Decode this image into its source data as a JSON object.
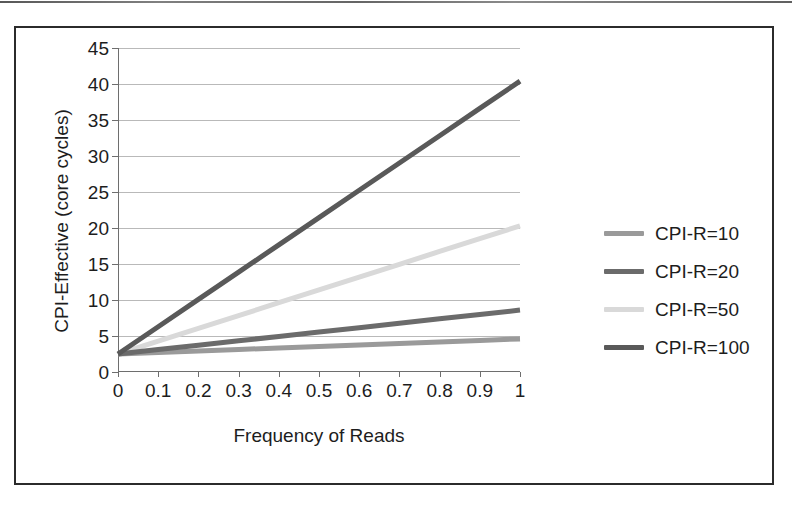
{
  "figure": {
    "has_frame": true,
    "background": "#ffffff"
  },
  "chart_data": {
    "type": "line",
    "title": "",
    "xlabel": "Frequency of Reads",
    "ylabel": "CPI-Effective (core cycles)",
    "xlim": [
      0,
      1
    ],
    "ylim": [
      0,
      45
    ],
    "x": [
      0,
      0.1,
      0.2,
      0.3,
      0.4,
      0.5,
      0.6,
      0.7,
      0.8,
      0.9,
      1
    ],
    "xticks": [
      "0",
      "0.1",
      "0.2",
      "0.3",
      "0.4",
      "0.5",
      "0.6",
      "0.7",
      "0.8",
      "0.9",
      "1"
    ],
    "yticks": [
      "0",
      "5",
      "10",
      "15",
      "20",
      "25",
      "30",
      "35",
      "40",
      "45"
    ],
    "grid": "horizontal",
    "legend_position": "right",
    "series": [
      {
        "name": "CPI-R=10",
        "color": "#9a9a9a",
        "values": [
          2.5,
          2.71,
          2.92,
          3.13,
          3.34,
          3.55,
          3.76,
          3.97,
          4.18,
          4.39,
          4.6
        ]
      },
      {
        "name": "CPI-R=20",
        "color": "#6b6b6b",
        "values": [
          2.5,
          3.11,
          3.72,
          4.33,
          4.94,
          5.55,
          6.16,
          6.77,
          7.38,
          7.99,
          8.6
        ]
      },
      {
        "name": "CPI-R=50",
        "color": "#d9d9d9",
        "values": [
          2.5,
          4.28,
          6.06,
          7.84,
          9.62,
          11.4,
          13.18,
          14.96,
          16.74,
          18.52,
          20.3
        ]
      },
      {
        "name": "CPI-R=100",
        "color": "#595959",
        "values": [
          2.5,
          6.29,
          10.08,
          13.87,
          17.66,
          21.45,
          25.24,
          29.03,
          32.82,
          36.61,
          40.4
        ]
      }
    ]
  },
  "legend": {
    "entries": [
      {
        "label": "CPI-R=10",
        "color": "#9a9a9a"
      },
      {
        "label": "CPI-R=20",
        "color": "#6b6b6b"
      },
      {
        "label": "CPI-R=50",
        "color": "#d9d9d9"
      },
      {
        "label": "CPI-R=100",
        "color": "#595959"
      }
    ]
  }
}
